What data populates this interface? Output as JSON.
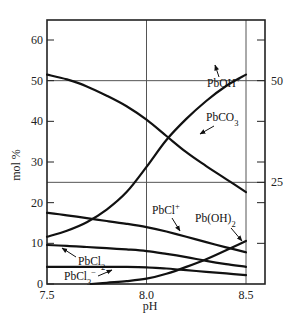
{
  "chart_data": {
    "type": "line",
    "title": "",
    "xlabel": "pH",
    "ylabel": "mol %",
    "xlim": [
      7.5,
      8.595
    ],
    "ylim": [
      0,
      65
    ],
    "x_ticks": [
      7.5,
      8.0,
      8.5
    ],
    "x_tick_labels": [
      "7.5",
      "8.0",
      "8.5"
    ],
    "y_ticks": [
      0,
      10,
      20,
      30,
      40,
      50,
      60
    ],
    "y_tick_labels": [
      "0",
      "10",
      "20",
      "30",
      "40",
      "50",
      "60"
    ],
    "right_axis": {
      "ticks": [
        10,
        20,
        25,
        30,
        40,
        50,
        60
      ],
      "labeled_ticks": [
        25,
        50
      ],
      "tick_labels": [
        "25",
        "50"
      ]
    },
    "gridlines": {
      "vertical_x": [
        8.0,
        8.5
      ],
      "horizontal_y": [
        25,
        50
      ]
    },
    "legend": "inline labels with arrows",
    "series": [
      {
        "name": "PbCO3",
        "label_main": "PbCO",
        "label_sub": "3",
        "label_sup": "",
        "x": [
          7.5,
          7.6,
          7.7,
          7.8,
          7.9,
          8.0,
          8.1,
          8.2,
          8.3,
          8.4,
          8.5
        ],
        "y": [
          51.5,
          50.3,
          48.6,
          46.3,
          43.7,
          40.4,
          36.4,
          32.4,
          29.0,
          25.8,
          22.6
        ]
      },
      {
        "name": "PbOH+",
        "label_main": "PbOH",
        "label_sub": "",
        "label_sup": "+",
        "x": [
          7.5,
          7.6,
          7.7,
          7.8,
          7.9,
          8.0,
          8.1,
          8.2,
          8.3,
          8.4,
          8.5
        ],
        "y": [
          11.6,
          13.1,
          15.2,
          18.3,
          22.6,
          28.8,
          35.4,
          40.6,
          45.0,
          48.7,
          51.5
        ]
      },
      {
        "name": "PbCl+",
        "label_main": "PbCl",
        "label_sub": "",
        "label_sup": "+",
        "x": [
          7.5,
          7.6,
          7.7,
          7.8,
          7.9,
          8.0,
          8.1,
          8.2,
          8.3,
          8.4,
          8.5
        ],
        "y": [
          17.5,
          16.9,
          16.2,
          15.5,
          14.8,
          14.0,
          12.9,
          11.6,
          10.3,
          9.0,
          7.8
        ]
      },
      {
        "name": "Pb(OH)2",
        "label_main": "Pb(OH)",
        "label_sub": "2",
        "label_sup": "",
        "x": [
          7.72,
          7.8,
          7.9,
          8.0,
          8.1,
          8.2,
          8.3,
          8.4,
          8.5
        ],
        "y": [
          0.0,
          0.3,
          0.7,
          1.3,
          2.5,
          4.2,
          6.1,
          8.3,
          10.6
        ]
      },
      {
        "name": "PbCl2",
        "label_main": "PbCl",
        "label_sub": "2",
        "label_sup": "",
        "x": [
          7.5,
          7.6,
          7.7,
          7.8,
          7.9,
          8.0,
          8.1,
          8.2,
          8.3,
          8.4,
          8.5
        ],
        "y": [
          9.6,
          9.4,
          9.1,
          8.8,
          8.5,
          8.1,
          7.4,
          6.6,
          5.7,
          4.9,
          4.2
        ]
      },
      {
        "name": "PbCl3-",
        "label_main": "PbCl",
        "label_sub": "3",
        "label_sup": "−",
        "x": [
          7.5,
          7.6,
          7.7,
          7.8,
          7.9,
          8.0,
          8.1,
          8.2,
          8.3,
          8.4,
          8.5
        ],
        "y": [
          4.2,
          4.2,
          4.2,
          4.2,
          4.2,
          4.1,
          3.8,
          3.4,
          3.0,
          2.6,
          2.2
        ]
      }
    ]
  }
}
